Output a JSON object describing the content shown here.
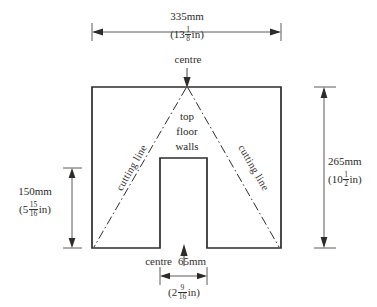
{
  "drawing": {
    "title": "cutting plan for top, floor and walls",
    "line_color": "#2e2c2a",
    "dim_color": "#4a4846",
    "background": "#ffffff",
    "dimensions": {
      "top": {
        "metric": "335mm",
        "imperial_whole": "13",
        "imperial_num": "1",
        "imperial_den": "8",
        "imperial_unit": "in",
        "imperial_open": "(",
        "imperial_close": "in)"
      },
      "right": {
        "metric": "265mm",
        "imperial_whole": "10",
        "imperial_num": "1",
        "imperial_den": "2",
        "imperial_open": "(",
        "imperial_close": "in)"
      },
      "left": {
        "metric": "150mm",
        "imperial_whole": "5",
        "imperial_num": "15",
        "imperial_den": "16",
        "imperial_open": "(",
        "imperial_close": "in)"
      },
      "bottom": {
        "centre_label": "centre",
        "metric": "65mm",
        "imperial_whole": "2",
        "imperial_num": "9",
        "imperial_den": "16",
        "imperial_open": "(",
        "imperial_close": "in)"
      }
    },
    "labels": {
      "centre_top": "centre",
      "part_1": "top",
      "part_2": "floor",
      "part_3": "walls",
      "cutting_line_left": "cutting line",
      "cutting_line_right": "cutting line"
    }
  }
}
